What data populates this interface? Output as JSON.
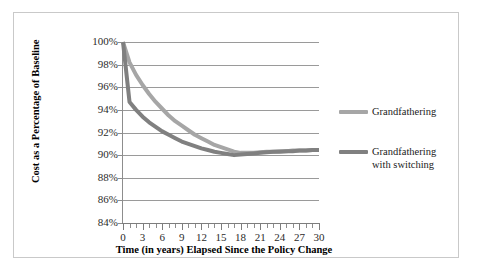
{
  "chart_data": {
    "type": "line",
    "title": "",
    "xlabel": "Time (in years) Elapsed Since the Policy Change",
    "ylabel": "Cost as a Percentage of\nBaseline",
    "xlim": [
      0,
      30
    ],
    "ylim": [
      84,
      100
    ],
    "x_tick_labels": [
      "0",
      "3",
      "6",
      "9",
      "12",
      "15",
      "18",
      "21",
      "24",
      "27",
      "30"
    ],
    "x_tick_values": [
      0,
      3,
      6,
      9,
      12,
      15,
      18,
      21,
      24,
      27,
      30
    ],
    "x_minor_tick_step": 1,
    "y_tick_labels": [
      "84%",
      "86%",
      "88%",
      "90%",
      "92%",
      "94%",
      "96%",
      "98%",
      "100%"
    ],
    "y_tick_values": [
      84,
      86,
      88,
      90,
      92,
      94,
      96,
      98,
      100
    ],
    "grid": "horizontal",
    "legend_position": "right",
    "x": [
      0,
      1,
      2,
      3,
      4,
      5,
      6,
      7,
      8,
      9,
      10,
      11,
      12,
      13,
      14,
      15,
      16,
      17,
      18,
      19,
      20,
      21,
      22,
      23,
      24,
      25,
      26,
      27,
      28,
      29,
      30
    ],
    "series": [
      {
        "name": "Grandfathering",
        "color": "#a6a6a6",
        "values": [
          100.0,
          98.2,
          97.1,
          96.2,
          95.4,
          94.7,
          94.1,
          93.5,
          93.0,
          92.6,
          92.2,
          91.8,
          91.5,
          91.2,
          90.9,
          90.7,
          90.5,
          90.3,
          90.2,
          90.2,
          90.2,
          90.25,
          90.3,
          90.3,
          90.35,
          90.35,
          90.4,
          90.4,
          90.4,
          90.45,
          90.45
        ]
      },
      {
        "name": "Grandfathering\nwith switching",
        "color": "#808080",
        "values": [
          100.0,
          94.7,
          94.0,
          93.4,
          92.9,
          92.5,
          92.1,
          91.8,
          91.5,
          91.2,
          91.0,
          90.8,
          90.6,
          90.45,
          90.3,
          90.2,
          90.1,
          90.0,
          90.05,
          90.1,
          90.15,
          90.2,
          90.25,
          90.3,
          90.3,
          90.35,
          90.35,
          90.4,
          90.4,
          90.45,
          90.45
        ]
      }
    ]
  },
  "legend": {
    "entries": [
      {
        "label": "Grandfathering"
      },
      {
        "label": "Grandfathering\nwith switching"
      }
    ]
  },
  "colors": {
    "series_grandfathering": "#a6a6a6",
    "series_with_switching": "#808080",
    "gridline": "#9a9a9a",
    "frame_border": "#c9c9c9",
    "text": "#1a1a1a"
  }
}
